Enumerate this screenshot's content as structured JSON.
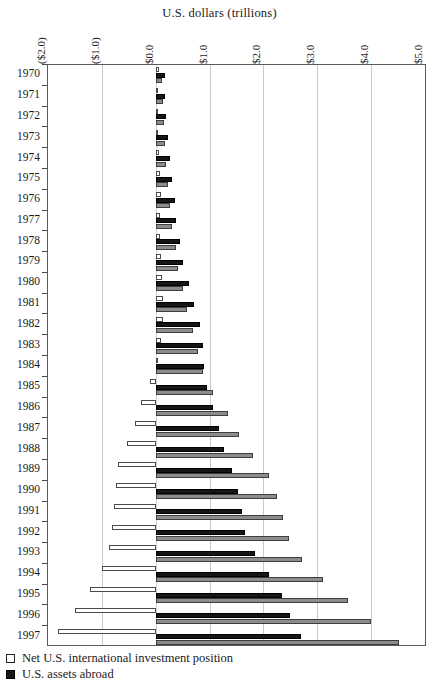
{
  "chart_data": {
    "type": "bar",
    "orientation": "horizontal",
    "title": "U.S. dollars (trillions)",
    "xlabel": "U.S. dollars (trillions)",
    "ylabel": "",
    "xlim": [
      -2.0,
      5.0
    ],
    "xticks": [
      -2.0,
      -1.0,
      0.0,
      1.0,
      2.0,
      3.0,
      4.0,
      5.0
    ],
    "xtick_labels": [
      "($2.0)",
      "($1.0)",
      "$0.0",
      "$1.0",
      "$2.0",
      "$3.0",
      "$4.0",
      "$5.0"
    ],
    "grid": true,
    "grid_axis": "x",
    "legend_position": "below-left",
    "categories": [
      "1970",
      "1971",
      "1972",
      "1973",
      "1974",
      "1975",
      "1976",
      "1977",
      "1978",
      "1979",
      "1980",
      "1981",
      "1982",
      "1983",
      "1984",
      "1985",
      "1986",
      "1987",
      "1988",
      "1989",
      "1990",
      "1991",
      "1992",
      "1993",
      "1994",
      "1995",
      "1996",
      "1997"
    ],
    "series": [
      {
        "name": "Net U.S. international investment position",
        "color": "#ffffff",
        "edge_color": "#4a4a4a",
        "values": [
          0.06,
          0.05,
          0.04,
          0.05,
          0.06,
          0.08,
          0.09,
          0.08,
          0.08,
          0.1,
          0.11,
          0.14,
          0.14,
          0.09,
          0.03,
          -0.11,
          -0.27,
          -0.38,
          -0.53,
          -0.7,
          -0.73,
          -0.77,
          -0.82,
          -0.86,
          -1.0,
          -1.22,
          -1.5,
          -1.82
        ]
      },
      {
        "name": "U.S. assets abroad",
        "color": "#161616",
        "edge_color": "#000000",
        "values": [
          0.17,
          0.18,
          0.2,
          0.22,
          0.26,
          0.3,
          0.35,
          0.38,
          0.45,
          0.51,
          0.61,
          0.72,
          0.83,
          0.87,
          0.9,
          0.95,
          1.07,
          1.17,
          1.27,
          1.41,
          1.53,
          1.6,
          1.66,
          1.85,
          2.1,
          2.35,
          2.49,
          2.7
        ]
      },
      {
        "name": "Foreign assets in the United States",
        "color": "#8c8c8c",
        "edge_color": "#3d3d3d",
        "values": [
          0.11,
          0.13,
          0.16,
          0.17,
          0.2,
          0.22,
          0.26,
          0.3,
          0.37,
          0.41,
          0.5,
          0.58,
          0.69,
          0.78,
          0.87,
          1.06,
          1.34,
          1.55,
          1.8,
          2.11,
          2.26,
          2.37,
          2.48,
          2.71,
          3.1,
          3.57,
          3.99,
          4.52
        ]
      }
    ]
  },
  "legend": [
    {
      "label": "Net U.S. international investment position",
      "swatch": "square-outline-white"
    },
    {
      "label": "U.S. assets abroad",
      "swatch": "square-filled-black"
    }
  ]
}
